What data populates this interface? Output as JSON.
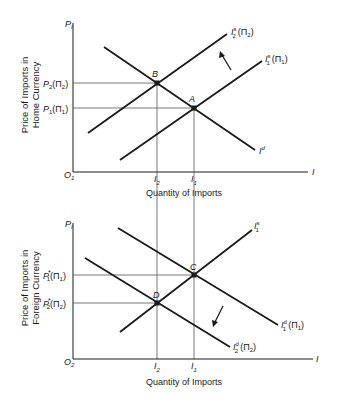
{
  "top_panel": {
    "y_axis_symbol": "P",
    "y_axis_symbol_sub": "I",
    "y_axis_title_line1": "Price of Imports in",
    "y_axis_title_line2": "Home Currency",
    "origin": "O",
    "origin_sub": "1",
    "x_axis_symbol": "I",
    "x_axis_title": "Quantity of Imports",
    "price_labels": [
      {
        "text": "P",
        "sub": "2",
        "suffix": "(Π",
        "suffix_sub": "2",
        "close": ")"
      },
      {
        "text": "P",
        "sub": "1",
        "suffix": "(Π",
        "suffix_sub": "1",
        "close": ")"
      }
    ],
    "qty_labels": [
      {
        "text": "I",
        "sub": "2"
      },
      {
        "text": "I",
        "sub": "1"
      }
    ],
    "points": {
      "B": "B",
      "A": "A"
    },
    "curves": {
      "demand": {
        "text": "I",
        "sup": "d"
      },
      "supply2": {
        "text": "I",
        "sup": "s",
        "sub": "2",
        "suffix": "(Π",
        "suffix_sub": "2",
        "close": ")"
      },
      "supply1": {
        "text": "I",
        "sup": "s",
        "sub": "1",
        "suffix": "(Π",
        "suffix_sub": "1",
        "close": ")"
      }
    }
  },
  "bottom_panel": {
    "y_axis_symbol": "P",
    "y_axis_symbol_sub": "I",
    "y_axis_title_line1": "Price of Imports in",
    "y_axis_title_line2": "Foreign Currency",
    "origin": "O",
    "origin_sub": "2",
    "x_axis_symbol": "I",
    "x_axis_title": "Quantity of Imports",
    "price_labels": [
      {
        "text": "P",
        "sup": "*",
        "sub": "1",
        "suffix": "(Π",
        "suffix_sub": "1",
        "close": ")"
      },
      {
        "text": "P",
        "sup": "*",
        "sub": "2",
        "suffix": "(Π",
        "suffix_sub": "2",
        "close": ")"
      }
    ],
    "qty_labels": [
      {
        "text": "I",
        "sub": "2"
      },
      {
        "text": "I",
        "sub": "1"
      }
    ],
    "points": {
      "C": "C",
      "D": "D"
    },
    "curves": {
      "supply": {
        "text": "I",
        "sup": "s",
        "sub": "1"
      },
      "demand1": {
        "text": "I",
        "sup": "d",
        "sub": "1",
        "suffix": "(Π",
        "suffix_sub": "1",
        "close": ")"
      },
      "demand2": {
        "text": "I",
        "sup": "d",
        "sub": "2",
        "suffix": "(Π",
        "suffix_sub": "2",
        "close": ")"
      }
    }
  },
  "colors": {
    "ink": "#1a1a1a",
    "guide": "#555555",
    "background": "#ffffff"
  }
}
